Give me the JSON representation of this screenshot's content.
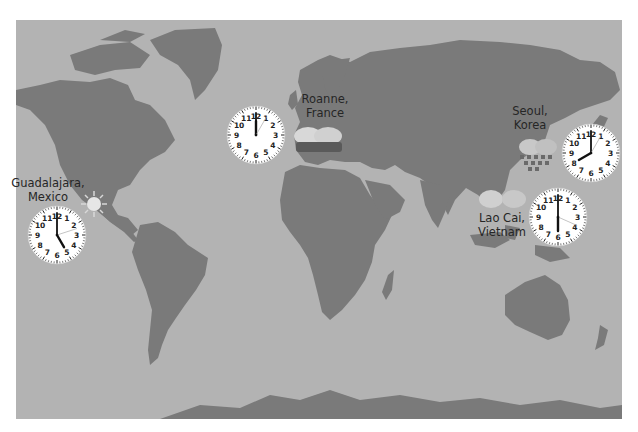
{
  "map": {
    "land_color": "#7a7a7a",
    "ocean_color": "#b3b3b3"
  },
  "locations": [
    {
      "id": "guadalajara",
      "label_line1": "Guadalajara,",
      "label_line2": "Mexico",
      "weather_icon": "sun-icon",
      "clock": {
        "hour": 5,
        "minute": 0,
        "second": 12,
        "display": "5:00"
      }
    },
    {
      "id": "roanne",
      "label_line1": "Roanne,",
      "label_line2": "France",
      "weather_icon": "storm-cloud-icon",
      "clock": {
        "hour": 12,
        "minute": 0,
        "second": 5,
        "display": "12:00"
      }
    },
    {
      "id": "seoul",
      "label_line1": "Seoul,",
      "label_line2": "Korea",
      "weather_icon": "rain-cloud-icon",
      "clock": {
        "hour": 8,
        "minute": 0,
        "second": 5,
        "display": "8:00"
      }
    },
    {
      "id": "laocai",
      "label_line1": "Lao Cai,",
      "label_line2": "Vietnam",
      "weather_icon": "cloud-icon",
      "clock": {
        "hour": 6,
        "minute": 0,
        "second": 19,
        "display": "6:00"
      }
    }
  ],
  "clock_numerals": [
    "12",
    "1",
    "2",
    "3",
    "4",
    "5",
    "6",
    "7",
    "8",
    "9",
    "10",
    "11"
  ]
}
